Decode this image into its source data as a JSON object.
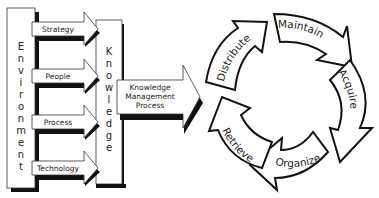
{
  "diagram": {
    "environment": {
      "label": "Environment",
      "letters": [
        "E",
        "n",
        "v",
        "i",
        "r",
        "o",
        "n",
        "m",
        "e",
        "n",
        "t"
      ]
    },
    "inputs": [
      {
        "label": "Strategy"
      },
      {
        "label": "People"
      },
      {
        "label": "Process"
      },
      {
        "label": "Technology"
      }
    ],
    "knowledge": {
      "label": "Knowledge",
      "letters": [
        "K",
        "n",
        "o",
        "w",
        "l",
        "e",
        "d",
        "g",
        "e"
      ]
    },
    "kmp_arrow": {
      "lines": [
        "Knowledge",
        "Management",
        "Process"
      ]
    },
    "cycle": {
      "steps": [
        {
          "label": "Maintain"
        },
        {
          "label": "Acquire"
        },
        {
          "label": "Organize"
        },
        {
          "label": "Retrieve"
        },
        {
          "label": "Distribute"
        }
      ]
    },
    "colors": {
      "stroke": "#1a1a1a",
      "shadow": "#111111",
      "fill": "#ffffff",
      "text": "#222222"
    }
  }
}
